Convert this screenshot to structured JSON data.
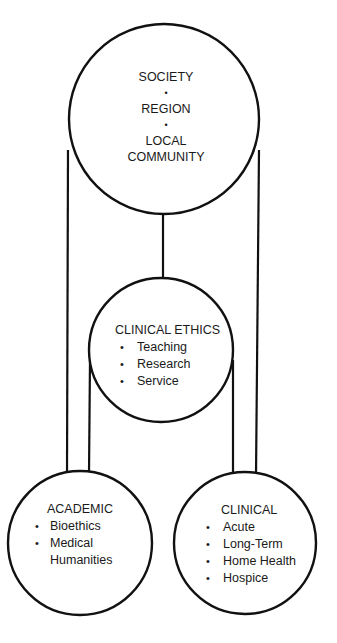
{
  "diagram": {
    "style": {
      "stroke_color": "#111111",
      "background": "#ffffff",
      "text_color": "#1a1a1a"
    },
    "nodes": {
      "society": {
        "lines": [
          "SOCIETY",
          "REGION",
          "LOCAL",
          "COMMUNITY"
        ],
        "separator": "•"
      },
      "clinical_ethics": {
        "title": "CLINICAL ETHICS",
        "items": [
          "Teaching",
          "Research",
          "Service"
        ]
      },
      "academic": {
        "title": "ACADEMIC",
        "items": [
          "Bioethics",
          "Medical",
          "Humanities"
        ]
      },
      "clinical": {
        "title": "CLINICAL",
        "items": [
          "Acute",
          "Long-Term",
          "Home Health",
          "Hospice"
        ]
      }
    },
    "bullet": "•",
    "edges": [
      {
        "from": "society",
        "to": "clinical_ethics"
      },
      {
        "from": "society",
        "to": "academic"
      },
      {
        "from": "society",
        "to": "clinical"
      },
      {
        "from": "clinical_ethics",
        "to": "academic"
      },
      {
        "from": "clinical_ethics",
        "to": "clinical"
      }
    ]
  }
}
